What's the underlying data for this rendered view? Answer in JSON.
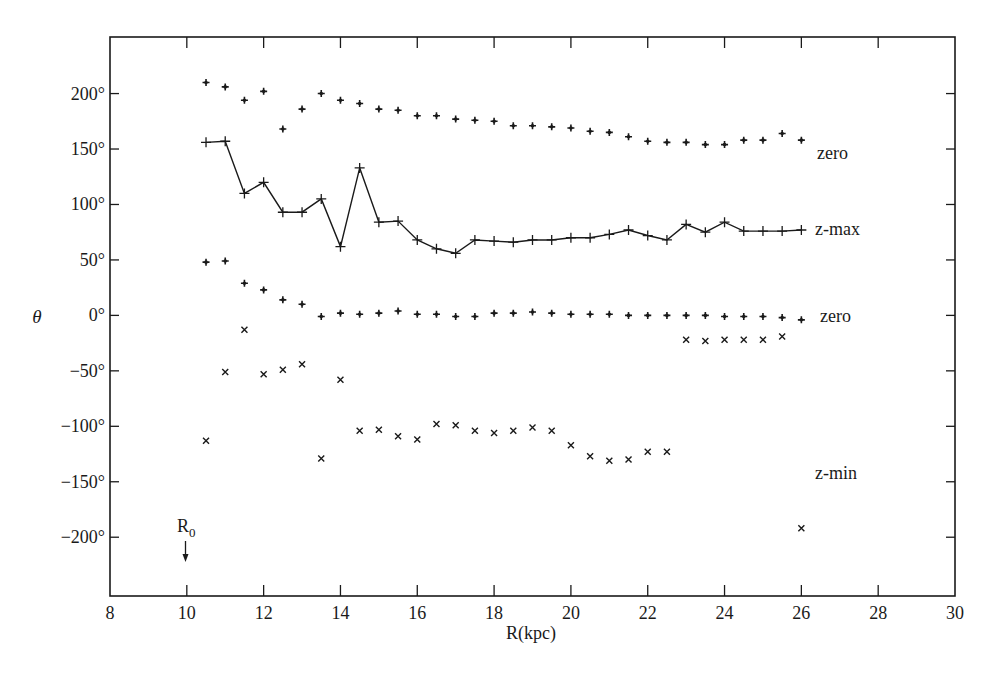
{
  "chart_data": {
    "type": "scatter",
    "title": "",
    "xlabel": "R(kpc)",
    "ylabel": "θ",
    "xlim": [
      8,
      30
    ],
    "ylim": [
      -253,
      251
    ],
    "x_ticks": [
      8,
      10,
      12,
      14,
      16,
      18,
      20,
      22,
      24,
      26,
      28,
      30
    ],
    "x_tick_labels": [
      "8",
      "10",
      "12",
      "14",
      "16",
      "18",
      "20",
      "22",
      "24",
      "26",
      "28",
      "30"
    ],
    "y_ticks": [
      200,
      150,
      100,
      50,
      0,
      -50,
      -100,
      -150,
      -200
    ],
    "y_tick_labels": [
      "200°",
      "150°",
      "100°",
      "50°",
      "0°",
      "−50°",
      "−100°",
      "−150°",
      "−200°"
    ],
    "grid": false,
    "legend": "inline labels at right end of series",
    "annotations": [
      {
        "text": "R",
        "subscript": "0",
        "x": 10,
        "arrow": "down",
        "meaning": "solar radius marker"
      }
    ],
    "series": [
      {
        "name": "zero",
        "marker": "plus-dot",
        "line": false,
        "label_text": "zero",
        "x": [
          10.5,
          11,
          11.5,
          12,
          12.5,
          13,
          13.5,
          14,
          14.5,
          15,
          15.5,
          16,
          16.5,
          17,
          17.5,
          18,
          18.5,
          19,
          19.5,
          20,
          20.5,
          21,
          21.5,
          22,
          22.5,
          23,
          23.5,
          24,
          24.5,
          25,
          25.5,
          26
        ],
        "y": [
          210,
          206,
          194,
          202,
          168,
          186,
          200,
          194,
          191,
          186,
          185,
          180,
          180,
          177,
          176,
          175,
          171,
          171,
          170,
          169,
          166,
          165,
          161,
          157,
          156,
          156,
          154,
          154,
          158,
          158,
          164,
          158
        ]
      },
      {
        "name": "z-max",
        "marker": "plus",
        "line": true,
        "label_text": "z-max",
        "x": [
          10.5,
          11,
          11.5,
          12,
          12.5,
          13,
          13.5,
          14,
          14.5,
          15,
          15.5,
          16,
          16.5,
          17,
          17.5,
          18,
          18.5,
          19,
          19.5,
          20,
          20.5,
          21,
          21.5,
          22,
          22.5,
          23,
          23.5,
          24,
          24.5,
          25,
          25.5,
          26
        ],
        "y": [
          156,
          157,
          110,
          120,
          93,
          93,
          105,
          62,
          133,
          84,
          85,
          68,
          60,
          56,
          68,
          67,
          66,
          68,
          68,
          70,
          70,
          73,
          77,
          72,
          68,
          82,
          75,
          84,
          76,
          76,
          76,
          77
        ]
      },
      {
        "name": "zero (lower)",
        "marker": "plus-dot",
        "line": false,
        "label_text": "zero",
        "x": [
          10.5,
          11,
          11.5,
          12,
          12.5,
          13,
          13.5,
          14,
          14.5,
          15,
          15.5,
          16,
          16.5,
          17,
          17.5,
          18,
          18.5,
          19,
          19.5,
          20,
          20.5,
          21,
          21.5,
          22,
          22.5,
          23,
          23.5,
          24,
          24.5,
          25,
          25.5,
          26
        ],
        "y": [
          48,
          49,
          29,
          23,
          14,
          10,
          -1,
          2,
          1,
          2,
          4,
          1,
          1,
          -1,
          -1,
          2,
          2,
          3,
          2,
          1,
          1,
          1,
          0,
          0,
          0,
          0,
          0,
          -1,
          -1,
          -1,
          -2,
          -4
        ]
      },
      {
        "name": "z-min",
        "marker": "cross",
        "line": false,
        "label_text": "z-min",
        "x": [
          10.5,
          11,
          11.5,
          12,
          12.5,
          13,
          13.5,
          14,
          14.5,
          15,
          15.5,
          16,
          16.5,
          17,
          17.5,
          18,
          18.5,
          19,
          19.5,
          20,
          20.5,
          21,
          21.5,
          22,
          22.5,
          23,
          23.5,
          24,
          24.5,
          25,
          25.5,
          26
        ],
        "y": [
          -113,
          -51,
          -13,
          -53,
          -49,
          -44,
          -129,
          -58,
          -104,
          -103,
          -109,
          -112,
          -98,
          -99,
          -104,
          -106,
          -104,
          -101,
          -104,
          -117,
          -127,
          -131,
          -130,
          -123,
          -123,
          -22,
          -23,
          -22,
          -22,
          -22,
          -19,
          -192
        ]
      }
    ],
    "series_label_positions": [
      {
        "text": "zero",
        "x_px": 817,
        "y_px": 159
      },
      {
        "text": "z-max",
        "x_px": 815,
        "y_px": 235
      },
      {
        "text": "zero",
        "x_px": 820,
        "y_px": 322
      },
      {
        "text": "z-min",
        "x_px": 815,
        "y_px": 479
      }
    ]
  },
  "axes": {
    "xlabel": "R(kpc)",
    "ylabel": "θ",
    "r0_main": "R",
    "r0_sub": "0"
  },
  "colors": {
    "ink": "#1a1a1a",
    "background": "#ffffff"
  }
}
